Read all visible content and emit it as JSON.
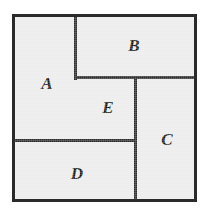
{
  "diagram": {
    "type": "rectangle-partition",
    "canvas": {
      "width": 212,
      "height": 216,
      "background": "#ffffff"
    },
    "frame": {
      "x": 12,
      "y": 14,
      "width": 185,
      "height": 188,
      "border_color": "#2a2a2a",
      "border_width": 3,
      "fill": "#ececec"
    },
    "line_color": "#2a2a2a",
    "line_width": 3,
    "fill_color": "#ececec",
    "label_color": "#111111",
    "regions": [
      {
        "id": "A",
        "label": "A",
        "x": 12,
        "y": 14,
        "width": 63,
        "height": 126,
        "label_x": 47,
        "label_y": 83
      },
      {
        "id": "B",
        "label": "B",
        "x": 75,
        "y": 14,
        "width": 122,
        "height": 63,
        "label_x": 134,
        "label_y": 45
      },
      {
        "id": "E",
        "label": "E",
        "x": 75,
        "y": 77,
        "width": 60,
        "height": 63,
        "label_x": 108,
        "label_y": 107
      },
      {
        "id": "C",
        "label": "C",
        "x": 135,
        "y": 77,
        "width": 62,
        "height": 125,
        "label_x": 167,
        "label_y": 139
      },
      {
        "id": "D",
        "label": "D",
        "x": 12,
        "y": 140,
        "width": 123,
        "height": 62,
        "label_x": 77,
        "label_y": 173
      }
    ],
    "dividers": [
      {
        "id": "divider-a-b",
        "orientation": "vertical",
        "x": 74,
        "y": 14,
        "length": 63
      },
      {
        "id": "divider-b-bottom",
        "orientation": "horizontal",
        "x": 74,
        "y": 76,
        "length": 123
      },
      {
        "id": "divider-e-c",
        "orientation": "vertical",
        "x": 134,
        "y": 76,
        "length": 126
      },
      {
        "id": "divider-d-top",
        "orientation": "horizontal",
        "x": 12,
        "y": 139,
        "length": 123
      }
    ]
  }
}
